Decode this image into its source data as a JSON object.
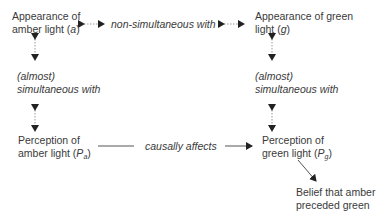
{
  "nodes": {
    "amber_appearance": {
      "line1": "Appearance of",
      "line2_pre": "amber light (",
      "line2_var": "a",
      "line2_post": ")"
    },
    "green_appearance": {
      "line1": "Appearance of green",
      "line2_pre": "light (",
      "line2_var": "g",
      "line2_post": ")"
    },
    "amber_perception": {
      "line1": "Perception of",
      "line2_pre": "amber light (",
      "line2_var": "P",
      "line2_sub": "a",
      "line2_post": ")"
    },
    "green_perception": {
      "line1": "Perception of",
      "line2_pre": "green light (",
      "line2_var": "P",
      "line2_sub": "g",
      "line2_post": ")"
    },
    "belief": {
      "line1": "Belief that amber",
      "line2": "preceded green"
    }
  },
  "relations": {
    "top": "non-simultaneous with",
    "left_line1": "(almost)",
    "left_line2": "simultaneous with",
    "right_line1": "(almost)",
    "right_line2": "simultaneous with",
    "bottom": "causally affects"
  },
  "colors": {
    "text": "#3a3a3a",
    "line": "#555555",
    "dotted": "#999999"
  }
}
